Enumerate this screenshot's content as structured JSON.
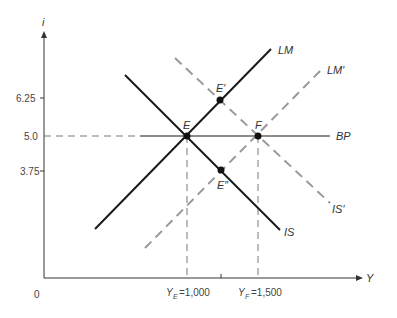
{
  "diagram": {
    "type": "IS-LM-BP",
    "axes": {
      "y_label": "i",
      "x_label": "Y",
      "origin_label": "0",
      "y_ticks": [
        "6.25",
        "5.0",
        "3.75"
      ],
      "x_ticks": [
        "Y_E = 1,000",
        "Y_F = 1,500"
      ]
    },
    "curves": {
      "LM": "LM",
      "LM_prime": "LM′",
      "IS": "IS",
      "IS_prime": "IS′",
      "BP": "BP"
    },
    "points": {
      "E": "E",
      "E_prime": "E′",
      "E_double_prime": "E″",
      "F": "F"
    },
    "x_tick_labels": {
      "ye_sym": "Y",
      "ye_sub": "E",
      "ye_val": "=1,000",
      "yf_sym": "Y",
      "yf_sub": "F",
      "yf_val": "=1,500"
    },
    "colors": {
      "solid_curve": "#1a1a1a",
      "dashed_curve": "#999999",
      "bp_line": "#8c8c8c",
      "axis": "#333333"
    }
  }
}
